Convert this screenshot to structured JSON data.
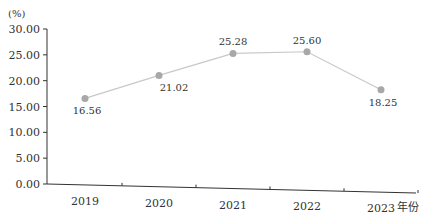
{
  "chart_data": {
    "type": "line",
    "title": "",
    "xlabel": "年份",
    "ylabel": "(%)",
    "categories": [
      "2019",
      "2020",
      "2021",
      "2022",
      "2023"
    ],
    "series": [
      {
        "name": "",
        "values": [
          16.56,
          21.02,
          25.28,
          25.6,
          18.25
        ]
      }
    ],
    "data_labels": [
      "16.56",
      "21.02",
      "25.28",
      "25.60",
      "18.25"
    ],
    "y_ticks": [
      "0.00",
      "5.00",
      "10.00",
      "15.00",
      "20.00",
      "25.00",
      "30.00"
    ],
    "ylim": [
      0,
      30
    ],
    "grid": false,
    "legend": "none",
    "colors": {
      "line": "#c8c8c8",
      "marker": "#a8a8a8",
      "axis": "#333333"
    }
  }
}
